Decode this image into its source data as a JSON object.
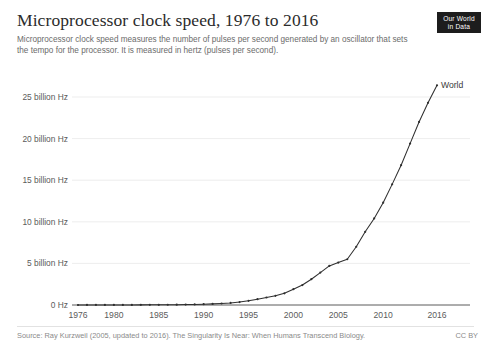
{
  "header": {
    "title": "Microprocessor clock speed, 1976 to 2016",
    "subtitle": "Microprocessor clock speed measures the number of pulses per second generated by an oscillator that sets the tempo for the processor. It is measured in hertz (pulses per second)."
  },
  "logo": {
    "line1": "Our World",
    "line2": "in Data"
  },
  "footer": {
    "source": "Source: Ray Kurzweil (2005, updated to 2016). The Singularity Is Near: When Humans Transcend Biology.",
    "license": "CC BY"
  },
  "colors": {
    "series": "#2f2f2f",
    "gridline": "#e8e8e8",
    "axis": "#5b5b5b",
    "title": "#2b2b2b",
    "muted": "#8a8a8a",
    "logo_background": "#1d1d1d"
  },
  "chart_data": {
    "type": "line",
    "title": "Microprocessor clock speed, 1976 to 2016",
    "subtitle": "Microprocessor clock speed measures the number of pulses per second generated by an oscillator that sets the tempo for the processor. It is measured in hertz (pulses per second).",
    "xlabel": "",
    "ylabel": "",
    "xlim": [
      1976,
      2016
    ],
    "ylim": [
      0,
      27000000000
    ],
    "grid": true,
    "legend_position": "series-end-label",
    "x_tick_labels": [
      "1976",
      "1980",
      "1985",
      "1990",
      "1995",
      "2000",
      "2005",
      "2010",
      "2016"
    ],
    "x_ticks": [
      1976,
      1980,
      1985,
      1990,
      1995,
      2000,
      2005,
      2010,
      2016
    ],
    "y_tick_labels": [
      "0 Hz",
      "5 billion Hz",
      "10 billion Hz",
      "15 billion Hz",
      "20 billion Hz",
      "25 billion Hz"
    ],
    "y_ticks": [
      0,
      5000000000,
      10000000000,
      15000000000,
      20000000000,
      25000000000
    ],
    "series": [
      {
        "name": "World",
        "end_label": "World",
        "color": "#2f2f2f",
        "x": [
          1976,
          1977,
          1978,
          1979,
          1980,
          1981,
          1982,
          1983,
          1984,
          1985,
          1986,
          1987,
          1988,
          1989,
          1990,
          1991,
          1992,
          1993,
          1994,
          1995,
          1996,
          1997,
          1998,
          1999,
          2000,
          2001,
          2002,
          2003,
          2004,
          2005,
          2006,
          2007,
          2008,
          2009,
          2010,
          2011,
          2012,
          2013,
          2014,
          2015,
          2016
        ],
        "values": [
          2000000,
          4000000,
          5000000,
          6000000,
          8000000,
          10000000,
          12000000,
          16000000,
          20000000,
          25000000,
          33000000,
          40000000,
          50000000,
          66000000,
          100000000,
          133000000,
          180000000,
          250000000,
          350000000,
          500000000,
          700000000,
          900000000,
          1100000000,
          1400000000,
          1900000000,
          2400000000,
          3100000000,
          3900000000,
          4700000000,
          5100000000,
          5500000000,
          7000000000,
          8800000000,
          10400000000,
          12300000000,
          14500000000,
          16800000000,
          19400000000,
          22000000000,
          24300000000,
          26400000000
        ]
      }
    ]
  }
}
